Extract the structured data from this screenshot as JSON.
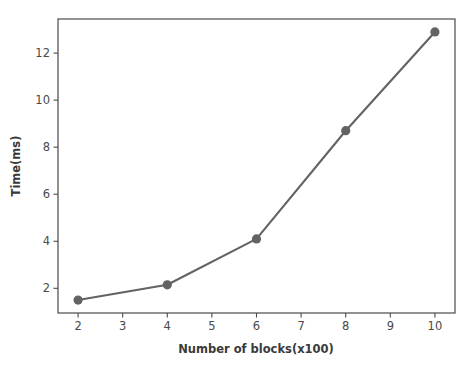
{
  "chart_data": {
    "type": "line",
    "title": "",
    "subtitle": "",
    "xlabel": "Number of blocks(x100)",
    "ylabel": "Time(ms)",
    "x": [
      2,
      4,
      6,
      8,
      10
    ],
    "values": [
      1.5,
      2.15,
      4.1,
      8.7,
      12.9
    ],
    "series": [
      {
        "name": "Time(ms)",
        "x": [
          2,
          4,
          6,
          8,
          10
        ],
        "values": [
          1.5,
          2.15,
          4.1,
          8.7,
          12.9
        ]
      }
    ],
    "xlim": [
      1.55,
      10.45
    ],
    "ylim": [
      0.95,
      13.45
    ],
    "xticks": [
      2,
      3,
      4,
      5,
      6,
      7,
      8,
      9,
      10
    ],
    "xticklabels": [
      "2",
      "3",
      "4",
      "5",
      "6",
      "7",
      "8",
      "9",
      "10"
    ],
    "yticks": [
      2,
      4,
      6,
      8,
      10,
      12
    ],
    "yticklabels": [
      "2",
      "4",
      "6",
      "8",
      "10",
      "12"
    ],
    "grid": false,
    "legend": null,
    "legend_position": "none",
    "marker": "circle",
    "annotations": [],
    "colors": {
      "line": "#636363",
      "marker": "#636363",
      "axis": "#4a4a4a",
      "text": "#3a3a3a",
      "background": "#ffffff",
      "page_border": "#d9d9d9"
    }
  }
}
